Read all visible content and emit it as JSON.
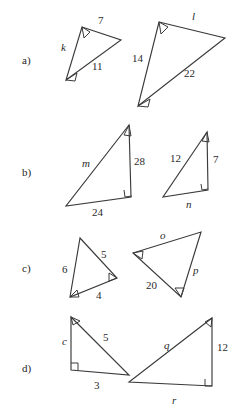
{
  "figure": {
    "width": 245,
    "height": 415,
    "background_color": "#ffffff",
    "stroke_color": "#3a3a3a",
    "text_color": "#2a2a2a"
  },
  "rows": [
    {
      "id": "a",
      "label": "a)",
      "label_x": 22,
      "label_y": 64,
      "triangles": [
        {
          "id": "a-left",
          "name": "triangle-a-small",
          "points": "82,27 121,40 66,80",
          "labels": [
            {
              "text": "7",
              "x": 98,
              "y": 24,
              "italic": false,
              "name": "side-label-7"
            },
            {
              "text": "k",
              "x": 61,
              "y": 51,
              "italic": true,
              "name": "side-label-k"
            },
            {
              "text": "11",
              "x": 92,
              "y": 70,
              "italic": false,
              "name": "side-label-11"
            }
          ],
          "angle_marks": [
            {
              "name": "angle-mark-vertex-top",
              "d": "M 82,27 L 90,32 L 84,38 Z",
              "vertex": "top"
            },
            {
              "name": "angle-mark-vertex-bottom",
              "d": "M 66,80 L 77,73 L 75,81 Z",
              "vertex": "bottom-left"
            }
          ]
        },
        {
          "id": "a-right",
          "name": "triangle-a-large",
          "points": "159,22 225,38 138,106",
          "labels": [
            {
              "text": "l",
              "x": 192,
              "y": 20,
              "italic": true,
              "name": "side-label-l"
            },
            {
              "text": "14",
              "x": 132,
              "y": 62,
              "italic": false,
              "name": "side-label-14"
            },
            {
              "text": "22",
              "x": 184,
              "y": 77,
              "italic": false,
              "name": "side-label-22"
            }
          ],
          "angle_marks": [
            {
              "name": "angle-mark-vertex-top",
              "d": "M 159,22 L 168,27 L 161,34 Z",
              "vertex": "top"
            },
            {
              "name": "angle-mark-vertex-bottom",
              "d": "M 138,106 L 150,99 L 148,107 Z",
              "vertex": "bottom-left"
            }
          ]
        }
      ]
    },
    {
      "id": "b",
      "label": "b)",
      "label_x": 22,
      "label_y": 176,
      "triangles": [
        {
          "id": "b-left",
          "name": "triangle-b-large",
          "points": "129,125 131,197 66,206",
          "labels": [
            {
              "text": "m",
              "x": 82,
              "y": 167,
              "italic": true,
              "name": "side-label-m"
            },
            {
              "text": "28",
              "x": 134,
              "y": 165,
              "italic": false,
              "name": "side-label-28"
            },
            {
              "text": "24",
              "x": 92,
              "y": 216,
              "italic": false,
              "name": "side-label-24"
            }
          ],
          "angle_marks": [
            {
              "name": "angle-mark-vertex-top",
              "d": "M 129,125 L 124,135 L 131,136 Z",
              "vertex": "top"
            }
          ],
          "right_marks": [
            {
              "name": "right-angle-mark",
              "d": "M 124,190 L 125,197 L 132,196",
              "vertex": "bottom-right"
            }
          ]
        },
        {
          "id": "b-right",
          "name": "triangle-b-small",
          "points": "207,132 208,190 163,197",
          "labels": [
            {
              "text": "12",
              "x": 170,
              "y": 162,
              "italic": false,
              "name": "side-label-12"
            },
            {
              "text": "7",
              "x": 213,
              "y": 163,
              "italic": false,
              "name": "side-label-7"
            },
            {
              "text": "n",
              "x": 186,
              "y": 208,
              "italic": true,
              "name": "side-label-n"
            }
          ],
          "angle_marks": [
            {
              "name": "angle-mark-vertex-top",
              "d": "M 207,132 L 202,141 L 209,142 Z",
              "vertex": "top"
            }
          ],
          "right_marks": [
            {
              "name": "right-angle-mark",
              "d": "M 201,184 L 202,190 L 208,189",
              "vertex": "bottom-right"
            }
          ]
        }
      ]
    },
    {
      "id": "c",
      "label": "c)",
      "label_x": 22,
      "label_y": 272,
      "triangles": [
        {
          "id": "c-left",
          "name": "triangle-c-small",
          "points": "80,238 117,278 70,297",
          "labels": [
            {
              "text": "5",
              "x": 101,
              "y": 258,
              "italic": false,
              "name": "side-label-5"
            },
            {
              "text": "6",
              "x": 62,
              "y": 273,
              "italic": false,
              "name": "side-label-6"
            },
            {
              "text": "4",
              "x": 96,
              "y": 299,
              "italic": false,
              "name": "side-label-4"
            }
          ],
          "angle_marks": [
            {
              "name": "angle-mark-vertex-right",
              "d": "M 117,278 L 109,273 L 109,281 Z",
              "vertex": "right"
            },
            {
              "name": "angle-mark-vertex-bottom",
              "d": "M 70,297 L 77,290 L 79,297 Z",
              "vertex": "bottom-left"
            }
          ]
        },
        {
          "id": "c-right",
          "name": "triangle-c-large",
          "points": "133,253 201,232 181,297",
          "labels": [
            {
              "text": "o",
              "x": 160,
              "y": 239,
              "italic": true,
              "name": "side-label-o"
            },
            {
              "text": "p",
              "x": 193,
              "y": 274,
              "italic": true,
              "name": "side-label-p"
            },
            {
              "text": "20",
              "x": 146,
              "y": 289,
              "italic": false,
              "name": "side-label-20"
            }
          ],
          "angle_marks": [
            {
              "name": "angle-mark-vertex-left",
              "d": "M 133,253 L 143,251 L 142,259 Z",
              "vertex": "left"
            },
            {
              "name": "angle-mark-vertex-bottom",
              "d": "M 181,297 L 175,288 L 184,288 Z",
              "vertex": "bottom"
            }
          ]
        }
      ]
    },
    {
      "id": "d",
      "label": "d)",
      "label_x": 22,
      "label_y": 372,
      "triangles": [
        {
          "id": "d-left",
          "name": "triangle-d-small",
          "points": "71,317 129,375 71,370",
          "labels": [
            {
              "text": "5",
              "x": 103,
              "y": 341,
              "italic": false,
              "name": "side-label-5"
            },
            {
              "text": "c",
              "x": 62,
              "y": 345,
              "italic": true,
              "name": "side-label-c"
            },
            {
              "text": "3",
              "x": 94,
              "y": 389,
              "italic": false,
              "name": "side-label-3"
            }
          ],
          "angle_marks": [
            {
              "name": "angle-mark-vertex-top",
              "d": "M 71,317 L 80,321 L 73,325 Z",
              "vertex": "top-left"
            }
          ],
          "right_marks": [
            {
              "name": "right-angle-mark",
              "d": "M 71,363 L 78,363 L 78,370",
              "vertex": "bottom-left"
            }
          ]
        },
        {
          "id": "d-right",
          "name": "triangle-d-large",
          "points": "212,318 212,386 129,382",
          "labels": [
            {
              "text": "q",
              "x": 164,
              "y": 349,
              "italic": true,
              "name": "side-label-q"
            },
            {
              "text": "12",
              "x": 217,
              "y": 351,
              "italic": false,
              "name": "side-label-12"
            },
            {
              "text": "r",
              "x": 172,
              "y": 404,
              "italic": true,
              "name": "side-label-r"
            }
          ],
          "angle_marks": [
            {
              "name": "angle-mark-vertex-top",
              "d": "M 212,318 L 205,322 L 211,327 Z",
              "vertex": "top-right"
            }
          ],
          "right_marks": [
            {
              "name": "right-angle-mark",
              "d": "M 205,379 L 205,386 L 212,386",
              "vertex": "bottom-right"
            }
          ]
        }
      ]
    }
  ]
}
